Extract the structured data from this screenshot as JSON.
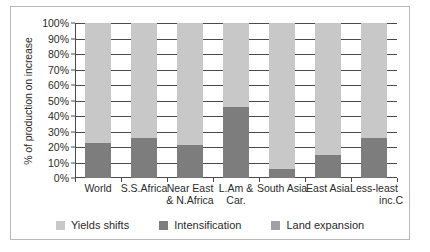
{
  "chart_data": {
    "type": "bar",
    "stacked": true,
    "normalized_percent": true,
    "title": "",
    "xlabel": "",
    "ylabel": "% of production on increase",
    "ylim": [
      0,
      100
    ],
    "grid": true,
    "legend_position": "bottom",
    "categories": [
      "World",
      "S.S.Africa",
      "Near East & N.Africa",
      "L.Am & Car.",
      "South Asia",
      "East Asia",
      "Less-least inc.C"
    ],
    "category_lines": [
      [
        "World",
        ""
      ],
      [
        "S.S.Africa",
        ""
      ],
      [
        "Near East",
        "& N.Africa"
      ],
      [
        "L.Am &",
        "Car."
      ],
      [
        "South Asia",
        ""
      ],
      [
        "East Asia",
        ""
      ],
      [
        "Less-least",
        "inc.C"
      ]
    ],
    "series": [
      {
        "name": "Land expansion",
        "color": "#a0a0a0",
        "values": [
          0,
          0,
          0,
          0,
          0,
          0,
          0
        ]
      },
      {
        "name": "Intensification",
        "color": "#7d7d7d",
        "values": [
          22.5,
          26,
          21,
          46,
          6,
          15,
          26
        ]
      },
      {
        "name": "Yields shifts",
        "color": "#c8c8c8",
        "values": [
          77.5,
          74,
          79,
          54,
          94,
          85,
          74
        ]
      }
    ],
    "y_ticks": [
      "0%",
      "10%",
      "20%",
      "30%",
      "40%",
      "50%",
      "60%",
      "70%",
      "80%",
      "90%",
      "100%"
    ],
    "y_tick_values": [
      0,
      10,
      20,
      30,
      40,
      50,
      60,
      70,
      80,
      90,
      100
    ]
  },
  "legend": {
    "items": [
      {
        "label": "Yields shifts",
        "color": "#c8c8c8"
      },
      {
        "label": "Intensification",
        "color": "#7d7d7d"
      },
      {
        "label": "Land expansion",
        "color": "#a0a0a0"
      }
    ]
  },
  "axis": {
    "y_title": "% of production on increase"
  }
}
